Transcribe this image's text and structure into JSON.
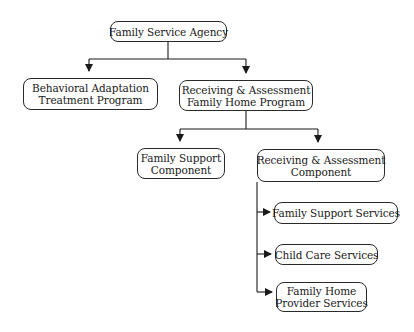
{
  "diagram": {
    "type": "org-chart",
    "nodes": [
      {
        "id": "fsa",
        "lines": [
          "Family Service Agency"
        ]
      },
      {
        "id": "batp",
        "lines": [
          "Behavioral Adaptation",
          "Treatment Program"
        ]
      },
      {
        "id": "rafhp",
        "lines": [
          "Receiving & Assessment",
          "Family Home Program"
        ]
      },
      {
        "id": "fsc",
        "lines": [
          "Family Support",
          "Component"
        ]
      },
      {
        "id": "rac",
        "lines": [
          "Receiving & Assessment",
          "Component"
        ]
      },
      {
        "id": "fss",
        "lines": [
          "Family Support Services"
        ]
      },
      {
        "id": "ccs",
        "lines": [
          "Child Care Services"
        ]
      },
      {
        "id": "fhps",
        "lines": [
          "Family Home",
          "Provider Services"
        ]
      }
    ],
    "edges": [
      {
        "from": "fsa",
        "to": "batp"
      },
      {
        "from": "fsa",
        "to": "rafhp"
      },
      {
        "from": "rafhp",
        "to": "fsc"
      },
      {
        "from": "rafhp",
        "to": "rac"
      },
      {
        "from": "rac",
        "to": "fss"
      },
      {
        "from": "rac",
        "to": "ccs"
      },
      {
        "from": "rac",
        "to": "fhps"
      }
    ],
    "colors": {
      "line": "#1a1a1a",
      "box_border": "#2a2a2a",
      "background": "#ffffff"
    }
  }
}
